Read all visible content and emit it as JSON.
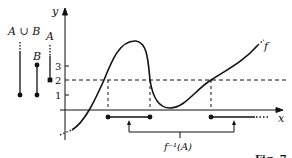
{
  "figure": {
    "y_axis_label": "y",
    "x_axis_label": "x",
    "curve_label": "f",
    "preimage_label": "f⁻¹(A)",
    "set_labels": {
      "union": "A ∪ B",
      "b": "B",
      "a": "A"
    },
    "ticks": [
      {
        "value": "3",
        "y": 66
      },
      {
        "value": "2",
        "y": 80
      },
      {
        "value": "1",
        "y": 95
      }
    ],
    "caption": "Fig. 7"
  }
}
